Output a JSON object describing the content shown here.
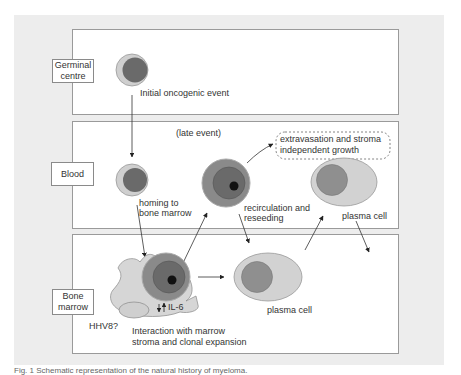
{
  "sections": [
    {
      "id": "germinal",
      "label": "Germinal centre"
    },
    {
      "id": "blood",
      "label": "Blood"
    },
    {
      "id": "marrow",
      "label": "Bone marrow"
    }
  ],
  "annotations": {
    "initial_event": "Initial oncogenic event",
    "late_event": "(late event)",
    "homing_line1": "homing to",
    "homing_line2": "bone marrow",
    "extravasation_line1": "extravasation and stroma",
    "extravasation_line2": "independent growth",
    "recirc_line1": "recirculation and",
    "recirc_line2": "reseeding",
    "plasma_cell_blood": "plasma cell",
    "plasma_cell_marrow": "plasma cell",
    "il6": "IL-6",
    "hhv8": "HHV8?",
    "interaction_line1": "Interaction with marrow",
    "interaction_line2": "stroma and clonal expansion"
  },
  "caption": "Fig. 1  Schematic representation of the natural history of myeloma.",
  "colors": {
    "panel_bg": "#ededed",
    "cell_outer_light": "#c8c8c8",
    "cell_nucleus_dark": "#6e6e6e",
    "cell_mid_ring": "#8c8c8c",
    "plasma_cytoplasm": "#cfcfcf",
    "plasma_nucleus": "#8f8f8f",
    "stroma": "#d4d4d4"
  }
}
